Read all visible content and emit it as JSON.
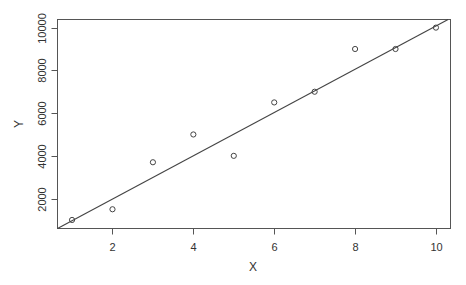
{
  "chart_data": {
    "type": "scatter",
    "title": "",
    "xlabel": "X",
    "ylabel": "Y",
    "x": [
      1,
      2,
      3,
      4,
      5,
      6,
      7,
      8,
      9,
      10
    ],
    "y": [
      1000,
      1500,
      3700,
      5000,
      4000,
      6500,
      7000,
      9000,
      9000,
      10000
    ],
    "xlim": [
      0.64,
      10.36
    ],
    "ylim": [
      600,
      10380
    ],
    "x_ticks": [
      2,
      4,
      6,
      8,
      10
    ],
    "x_tick_labels": [
      "2",
      "4",
      "6",
      "8",
      "10"
    ],
    "y_ticks": [
      2000,
      4000,
      6000,
      8000,
      10000
    ],
    "y_tick_labels": [
      "2000",
      "4000",
      "6000",
      "8000",
      "10000"
    ],
    "fit_line": {
      "type": "linear",
      "x0": 0.64,
      "y0": 600,
      "x1": 10.3,
      "y1": 10380
    },
    "grid": false,
    "legend": null,
    "marker": "open-circle"
  },
  "colors": {
    "axis": "#555555",
    "points": "#444444",
    "line": "#444444",
    "text": "#333333"
  }
}
